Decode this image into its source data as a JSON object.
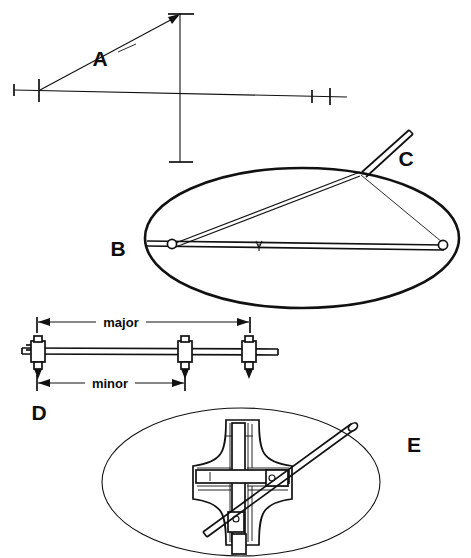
{
  "figure": {
    "background_color": "#ffffff",
    "ink_color": "#111111",
    "width": 471,
    "height": 558
  },
  "panels": [
    {
      "key": "A",
      "label": "A",
      "name": "axes-construction",
      "description": "Major and minor axis lines crossing, with tick marks and a diagonal leader arrow labelled A"
    },
    {
      "key": "B",
      "label": "B",
      "name": "string-and-pins-ellipse",
      "description": "Ellipse drawn by the two-pin and string trammel method, showing both foci pins and the taut cord"
    },
    {
      "key": "C",
      "label": "C",
      "name": "pencil-at-cord",
      "description": "Pencil held against the taut cord at the ellipse curve"
    },
    {
      "key": "D",
      "label": "D",
      "name": "trammel-beam-compass",
      "description": "Beam trammel bar carrying three sliding scriber collars set to the major and minor half-axis distances"
    },
    {
      "key": "E",
      "label": "E",
      "name": "ellipsograph-cross-guide",
      "description": "Trammel of Archimedes: cruciform slotted guide with a diagonal arm tracing the ellipse"
    }
  ],
  "dimensions": {
    "major_label": "major",
    "minor_label": "minor"
  },
  "panel_a": {
    "horizontal_axis_name": "major-axis-line",
    "vertical_axis_name": "minor-axis-line",
    "tick_count_left": 2,
    "tick_count_right": 2,
    "leader_label": "A"
  },
  "panel_b": {
    "focus_left_name": "focus-pin-left",
    "focus_right_name": "focus-pin-right",
    "center_mark_name": "center-mark",
    "cord_name": "taut-cord"
  },
  "panel_d": {
    "slider_count": 3,
    "slider_names": [
      "scriber-collar-left",
      "scriber-collar-middle",
      "scriber-collar-right"
    ]
  },
  "panel_e": {
    "arm_name": "tracing-arm",
    "cross_name": "cruciform-slot-guide",
    "shoe_count": 2
  }
}
